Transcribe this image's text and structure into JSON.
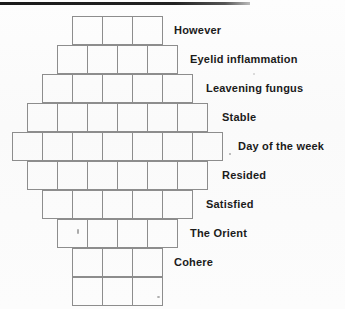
{
  "page": {
    "background_color": "#fdfdfd",
    "line_color": "#8d8d8d",
    "text_color": "#1b1b1b",
    "rule_color": "#1a1a1a"
  },
  "diagram": {
    "type": "diamond-crossword-grid",
    "row_height_px": 29,
    "cell_width_px": 31,
    "rows": [
      {
        "index": 1,
        "cells": 3,
        "left": 72,
        "top": 16,
        "label": "However"
      },
      {
        "index": 2,
        "cells": 4,
        "left": 57,
        "top": 45,
        "label": "Eyelid inflammation"
      },
      {
        "index": 3,
        "cells": 5,
        "left": 42,
        "top": 74,
        "label": "Leavening fungus"
      },
      {
        "index": 4,
        "cells": 6,
        "left": 27,
        "top": 103,
        "label": "Stable"
      },
      {
        "index": 5,
        "cells": 7,
        "left": 12,
        "top": 132,
        "label": "Day of the week"
      },
      {
        "index": 6,
        "cells": 6,
        "left": 27,
        "top": 161,
        "label": "Resided"
      },
      {
        "index": 7,
        "cells": 5,
        "left": 42,
        "top": 190,
        "label": "Satisfied"
      },
      {
        "index": 8,
        "cells": 4,
        "left": 57,
        "top": 219,
        "label": "The Orient"
      },
      {
        "index": 9,
        "cells": 3,
        "left": 72,
        "top": 248,
        "label": "Cohere"
      },
      {
        "index": 10,
        "cells": 3,
        "left": 72,
        "top": 277,
        "label": ""
      }
    ],
    "labels": [
      "However",
      "Eyelid inflammation",
      "Leavening fungus",
      "Stable",
      "Day of the week",
      "Resided",
      "Satisfied",
      "The Orient",
      "Cohere"
    ]
  }
}
